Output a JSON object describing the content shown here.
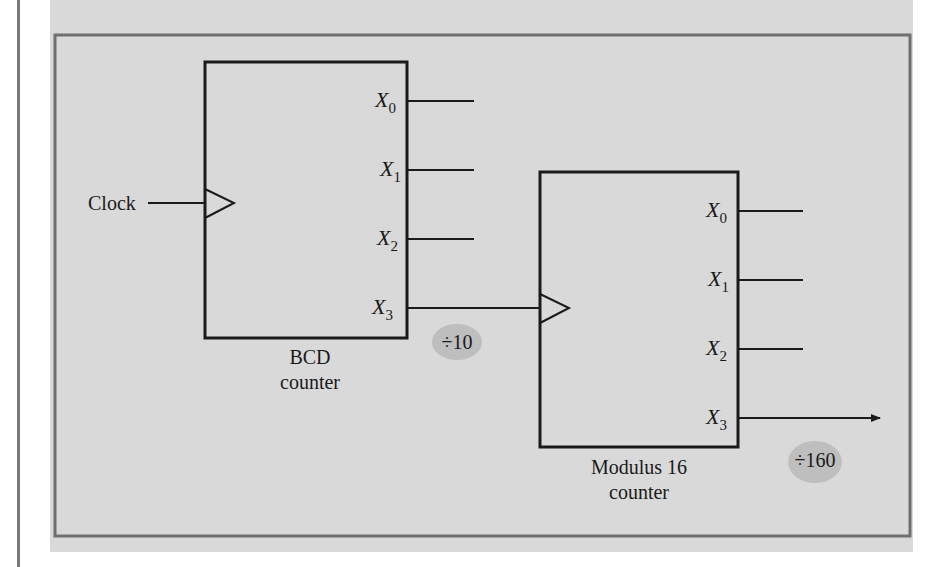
{
  "colors": {
    "panel_bg": "#d9d9d9",
    "frame": "#6f6f6f",
    "wire": "#1a1a1a",
    "badge_fill": "#b9b9b9"
  },
  "clock": {
    "label": "Clock"
  },
  "bcd_counter": {
    "caption_line1": "BCD",
    "caption_line2": "counter",
    "outputs": [
      {
        "name": "X",
        "sub": "0"
      },
      {
        "name": "X",
        "sub": "1"
      },
      {
        "name": "X",
        "sub": "2"
      },
      {
        "name": "X",
        "sub": "3"
      }
    ],
    "divide_badge": "÷10"
  },
  "mod16_counter": {
    "caption_line1": "Modulus 16",
    "caption_line2": "counter",
    "outputs": [
      {
        "name": "X",
        "sub": "0"
      },
      {
        "name": "X",
        "sub": "1"
      },
      {
        "name": "X",
        "sub": "2"
      },
      {
        "name": "X",
        "sub": "3"
      }
    ],
    "divide_badge": "÷160"
  }
}
